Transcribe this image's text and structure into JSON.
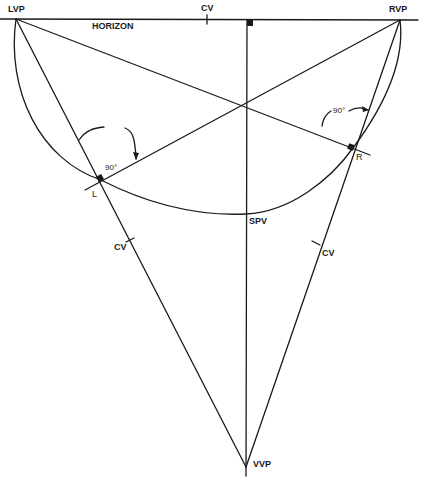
{
  "figure": {
    "ink_color": "#1a1a1a",
    "background": "#ffffff",
    "labels": {
      "lvp": "LVP",
      "rvp": "RVP",
      "vvp": "VVP",
      "horizon": "HORIZON",
      "cv_horizon": "CV",
      "cv_left": "CV",
      "cv_right": "CV",
      "spv": "SPV",
      "point_l": "L",
      "point_r": "R",
      "angle_left": "90°",
      "angle_right": "90°"
    },
    "points": {
      "LVP": [
        16,
        19
      ],
      "RVP": [
        400,
        20
      ],
      "VVP": [
        246,
        467
      ],
      "L": [
        101,
        180
      ],
      "R": [
        353,
        148
      ],
      "SPV": [
        246,
        214
      ],
      "center": [
        246,
        104
      ]
    }
  }
}
